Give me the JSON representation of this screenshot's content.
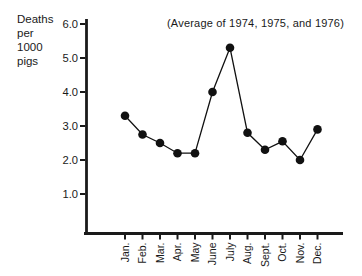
{
  "chart": {
    "y_axis_title": "Deaths\nper\n1000\npigs",
    "annotation": "(Average of 1974, 1975, and 1976)"
  },
  "chart_data": {
    "type": "line",
    "title": "",
    "annotation": "(Average of 1974, 1975, and 1976)",
    "ylabel": "Deaths per 1000 pigs",
    "xlabel": "",
    "categories": [
      "Jan.",
      "Feb.",
      "Mar.",
      "Apr.",
      "May",
      "June",
      "July",
      "Aug.",
      "Sept.",
      "Oct.",
      "Nov.",
      "Dec."
    ],
    "values": [
      3.3,
      2.75,
      2.5,
      2.2,
      2.2,
      4.0,
      5.3,
      2.8,
      2.3,
      2.55,
      2.0,
      2.9
    ],
    "yticks": [
      1.0,
      2.0,
      3.0,
      4.0,
      5.0,
      6.0
    ],
    "ytick_labels": [
      "1.0",
      "2.0",
      "3.0",
      "4.0",
      "5.0",
      "6.0"
    ],
    "ylim": [
      0,
      6.2
    ],
    "grid": false,
    "legend": null,
    "marker": "filled-circle",
    "line_color": "#111111",
    "marker_color": "#111111",
    "axis_color": "#1a1a1a"
  }
}
